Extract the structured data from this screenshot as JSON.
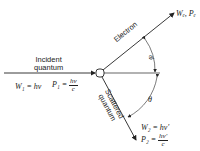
{
  "incident": {
    "label_line1": "Incident",
    "label_line2": "quantum",
    "energy": "W₁ = hν",
    "momentum_lhs": "P₁ =",
    "momentum_num": "hν",
    "momentum_den": "c"
  },
  "electron": {
    "label": "Electron",
    "result": "Wₑ, Pₑ",
    "angle": "φ"
  },
  "scattered": {
    "label_line1": "Scattered",
    "label_line2": "quantum",
    "energy": "W₂ = hν′",
    "momentum_lhs": "P₂ =",
    "momentum_num": "hν′",
    "momentum_den": "c",
    "angle": "θ"
  },
  "colors": {
    "ink": "#222222"
  }
}
